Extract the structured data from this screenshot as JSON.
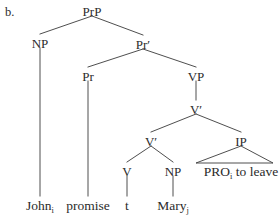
{
  "figure": {
    "item_label": "b.",
    "ink_color": "#2b2b2b",
    "line_color": "#3a3a3a",
    "background_color": "#ffffff"
  },
  "chart_data": {
    "type": "diagram",
    "diagram_kind": "syntax-tree",
    "title": "b.",
    "nodes": [
      {
        "id": "PrP",
        "label": "PrP",
        "x": 92,
        "y": 12,
        "kind": "phrase"
      },
      {
        "id": "NP1",
        "label": "NP",
        "x": 40,
        "y": 44,
        "kind": "phrase"
      },
      {
        "id": "Prbar",
        "label": "Pr′",
        "x": 143,
        "y": 45,
        "kind": "bar"
      },
      {
        "id": "Pr",
        "label": "Pr",
        "x": 88,
        "y": 77,
        "kind": "head"
      },
      {
        "id": "VP",
        "label": "VP",
        "x": 196,
        "y": 77,
        "kind": "phrase"
      },
      {
        "id": "Vbar1",
        "label": "V′",
        "x": 196,
        "y": 110,
        "kind": "bar"
      },
      {
        "id": "Vbar2",
        "label": "V′",
        "x": 151,
        "y": 142,
        "kind": "bar"
      },
      {
        "id": "IP",
        "label": "IP",
        "x": 241,
        "y": 142,
        "kind": "phrase"
      },
      {
        "id": "V",
        "label": "V",
        "x": 127,
        "y": 172,
        "kind": "head"
      },
      {
        "id": "NP2",
        "label": "NP",
        "x": 173,
        "y": 172,
        "kind": "phrase"
      }
    ],
    "leaves": [
      {
        "id": "John",
        "text": "John",
        "subscript": "i",
        "x": 40,
        "y": 206
      },
      {
        "id": "promise",
        "text": "promise",
        "subscript": "",
        "x": 88,
        "y": 206
      },
      {
        "id": "t",
        "text": "t",
        "subscript": "",
        "x": 127,
        "y": 206
      },
      {
        "id": "Mary",
        "text": "Mary",
        "subscript": "j",
        "x": 173,
        "y": 206
      },
      {
        "id": "PROspan",
        "text": "PRO",
        "subscript": "i",
        "suffix": " to leave",
        "x": 241,
        "y": 172
      }
    ],
    "edges": [
      {
        "from": "PrP",
        "to": "NP1"
      },
      {
        "from": "PrP",
        "to": "Prbar"
      },
      {
        "from": "Prbar",
        "to": "Pr"
      },
      {
        "from": "Prbar",
        "to": "VP"
      },
      {
        "from": "VP",
        "to": "Vbar1"
      },
      {
        "from": "Vbar1",
        "to": "Vbar2"
      },
      {
        "from": "Vbar1",
        "to": "IP"
      },
      {
        "from": "Vbar2",
        "to": "V"
      },
      {
        "from": "Vbar2",
        "to": "NP2"
      },
      {
        "from": "NP1",
        "to": "John"
      },
      {
        "from": "Pr",
        "to": "promise"
      },
      {
        "from": "V",
        "to": "t"
      },
      {
        "from": "NP2",
        "to": "Mary"
      }
    ],
    "triangles": [
      {
        "from": "IP",
        "left_x": 196,
        "right_x": 273,
        "base_y": 163
      }
    ]
  }
}
